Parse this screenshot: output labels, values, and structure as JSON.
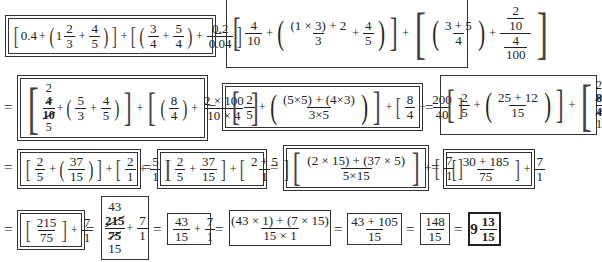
{
  "problem": {
    "rows": [
      {
        "steps": [
          {
            "id": "s1",
            "text": "[0.4 + (1 2/3 + 4/5)] + [(3/4 + 5/4) + 0.2/0.04]",
            "parts": {
              "a": "0.4",
              "b_whole": "1",
              "b_num": "2",
              "b_den": "3",
              "c_num": "4",
              "c_den": "5",
              "d_num": "3",
              "d_den": "4",
              "e_num": "5",
              "e_den": "4",
              "f_num": "0.2",
              "f_den": "0.04"
            }
          },
          {
            "id": "s2",
            "text": "[4/10 + ((1×3)+2)/3 + 4/5] + [(3+5)/4 + (2/10)/(4/100)]",
            "parts": {
              "a_num": "4",
              "a_den": "10",
              "b_num": "(1 × 3) + 2",
              "b_den": "3",
              "c_num": "4",
              "c_den": "5",
              "d_num": "3 + 5",
              "d_den": "4",
              "e_top_num": "2",
              "e_top_den": "10",
              "e_bot_num": "4",
              "e_bot_den": "100"
            }
          }
        ]
      },
      {
        "steps": [
          {
            "id": "s3",
            "text": "[(2/4 cancel)/(10/5 cancel) + (5/3 + 4/5)] + [(8/4) + (2×100)/(10×4)]",
            "parts": {
              "a_top_small": "2",
              "a_num": "4",
              "a_den": "10",
              "a_bot_small": "5",
              "b_num": "5",
              "b_den": "3",
              "c_num": "4",
              "c_den": "5",
              "d_num": "8",
              "d_den": "4",
              "e_num": "2 × 100",
              "e_den": "10 × 4"
            }
          },
          {
            "id": "s4",
            "text": "[2/5 + ((5×5)+(4×3))/(3×5)] + [8/4 + 200/40]",
            "parts": {
              "a_num": "2",
              "a_den": "5",
              "b_num": "(5×5) + (4×3)",
              "b_den": "3×5",
              "c_num": "8",
              "c_den": "4",
              "d_num": "200",
              "d_den": "40"
            }
          },
          {
            "id": "s5",
            "text": "[2/5 + ((25+12)/15)] + [8/4 + 200/40 cancel → 2/1 + 5/1]",
            "parts": {
              "a_num": "2",
              "a_den": "5",
              "b_num": "25 + 12",
              "b_den": "15",
              "c_top": "2",
              "c_num": "8",
              "c_den": "4",
              "c_bot": "1",
              "d_top": "5",
              "d_num": "200",
              "d_den": "40",
              "d_bot": "1"
            }
          }
        ]
      },
      {
        "steps": [
          {
            "id": "s6",
            "text": "[2/5 + (37/15)] + [2/1 + 5/1]",
            "parts": {
              "a_num": "2",
              "a_den": "5",
              "b_num": "37",
              "b_den": "15",
              "c_num": "2",
              "c_den": "1",
              "d_num": "5",
              "d_den": "1"
            }
          },
          {
            "id": "s7",
            "text": "[2/5 + 37/15] + [(2+5)/1]",
            "parts": {
              "a_num": "2",
              "a_den": "5",
              "b_num": "37",
              "b_den": "15",
              "c_num": "2 + 5",
              "c_den": "1"
            }
          },
          {
            "id": "s8",
            "text": "[((2×15)+(37×5))/(5×15)] + [7/1]",
            "parts": {
              "a_num": "(2 × 15) + (37 × 5)",
              "a_den": "5×15",
              "b_num": "7",
              "b_den": "1"
            }
          },
          {
            "id": "s9",
            "text": "[(30+185)/75] + 7/1",
            "parts": {
              "a_num": "30 + 185",
              "a_den": "75",
              "b_num": "7",
              "b_den": "1"
            }
          }
        ]
      },
      {
        "steps": [
          {
            "id": "s10",
            "text": "[215/75] + 7/1",
            "parts": {
              "a_num": "215",
              "a_den": "75",
              "b_num": "7",
              "b_den": "1"
            }
          },
          {
            "id": "s11",
            "text": "(215 cancel 43)/(75 cancel 15) + 7/1",
            "parts": {
              "a_top": "43",
              "a_num": "215",
              "a_den": "75",
              "a_bot": "15",
              "b_num": "7",
              "b_den": "1"
            }
          },
          {
            "id": "s12",
            "text": "43/15 + 7/1",
            "parts": {
              "a_num": "43",
              "a_den": "15",
              "b_num": "7",
              "b_den": "1"
            }
          },
          {
            "id": "s13",
            "text": "((43×1)+(7×15))/(15×1)",
            "parts": {
              "a_num": "(43 × 1) + (7 × 15)",
              "a_den": "15 × 1"
            }
          },
          {
            "id": "s14",
            "text": "(43+105)/15",
            "parts": {
              "a_num": "43 + 105",
              "a_den": "15"
            }
          },
          {
            "id": "s15",
            "text": "148/15",
            "parts": {
              "a_num": "148",
              "a_den": "15"
            }
          },
          {
            "id": "s16",
            "text": "9 13/15",
            "parts": {
              "whole": "9",
              "num": "13",
              "den": "15"
            }
          }
        ]
      }
    ],
    "symbols": {
      "equals": "=",
      "plus": "+",
      "lbr": "[",
      "rbr": "]",
      "lpar": "(",
      "rpar": ")"
    },
    "final_answer": "9 13/15"
  }
}
